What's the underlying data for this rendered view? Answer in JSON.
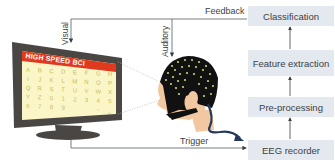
{
  "pipeline": {
    "boxes": [
      {
        "label": "Classification"
      },
      {
        "label": "Feature extraction"
      },
      {
        "label": "Pre-processing"
      },
      {
        "label": "EEG recorder"
      }
    ]
  },
  "connections": {
    "feedback_label": "Feedback",
    "visual_label": "Visual",
    "auditory_label": "Auditory",
    "trigger_label": "Trigger"
  },
  "monitor": {
    "title": "HIGH SPEED BCI",
    "grid": [
      [
        "A",
        "B",
        "C",
        "D",
        "E",
        "F",
        "G",
        "H"
      ],
      [
        "I",
        "J",
        "K",
        "L",
        "M",
        "N",
        "O",
        "P"
      ],
      [
        "Q",
        "R",
        "S",
        "T",
        "U",
        "V",
        "W",
        "X"
      ],
      [
        "Y",
        "Z",
        "0",
        "1",
        "2",
        "3",
        "4",
        "5"
      ],
      [
        "6",
        "7",
        "8",
        "9",
        "",
        "",
        "-",
        "_"
      ]
    ]
  },
  "colors": {
    "box_fill": "#e4e8ef",
    "line": "#5a5f66",
    "monitor_frame": "#4a4644",
    "header_red": "#e03a1e",
    "screen_bg": "#fbf6c8",
    "cap": "#111111",
    "electrode": "#c9d36a",
    "skin": "#f2c8a2",
    "cable": "#27395a"
  }
}
